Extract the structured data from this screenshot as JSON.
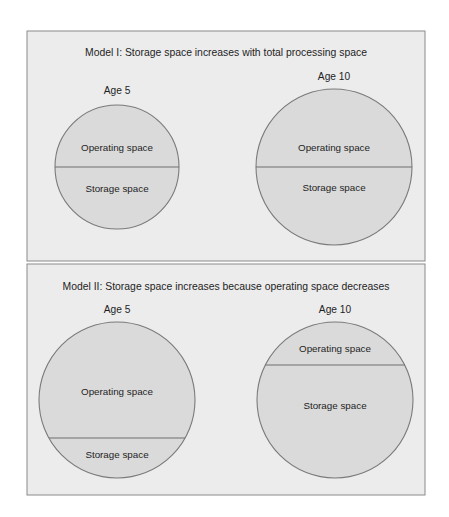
{
  "colors": {
    "page_background": "#ffffff",
    "panel_background": "#ececec",
    "panel_border": "#8a8a8a",
    "circle_fill": "#dadada",
    "circle_stroke": "#7a7a7a",
    "text": "#1e1e1e"
  },
  "models": [
    {
      "title": "Model I:  Storage space increases with total processing space",
      "circles": [
        {
          "age_label": "Age 5",
          "top_label": "Operating space",
          "bottom_label": "Storage space"
        },
        {
          "age_label": "Age 10",
          "top_label": "Operating space",
          "bottom_label": "Storage space"
        }
      ]
    },
    {
      "title": "Model II:  Storage space increases because operating space decreases",
      "circles": [
        {
          "age_label": "Age 5",
          "top_label": "Operating space",
          "bottom_label": "Storage space"
        },
        {
          "age_label": "Age 10",
          "top_label": "Operating space",
          "bottom_label": "Storage space"
        }
      ]
    }
  ]
}
